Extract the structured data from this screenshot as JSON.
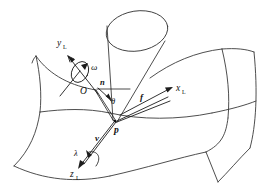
{
  "figure": {
    "kind": "geometry-diagram",
    "background_color": "#ffffff",
    "line_color": "#3a3a3a",
    "label_color": "#111111"
  },
  "labels": {
    "axis_x": "x",
    "axis_x_sub": "L",
    "axis_y": "y",
    "axis_y_sub": "L",
    "axis_z": "z",
    "axis_z_sub": "L",
    "point_o": "O",
    "point_p": "p",
    "vector_n": "n",
    "vector_f": "f",
    "vector_v": "v",
    "angle_theta": "θ",
    "angle_omega": "ω",
    "angle_lambda": "λ"
  },
  "elements": {
    "surface": "saddle-surface",
    "beam": "cylindrical-beam",
    "origin": "origin-point-o",
    "contact": "contact-point-p"
  }
}
